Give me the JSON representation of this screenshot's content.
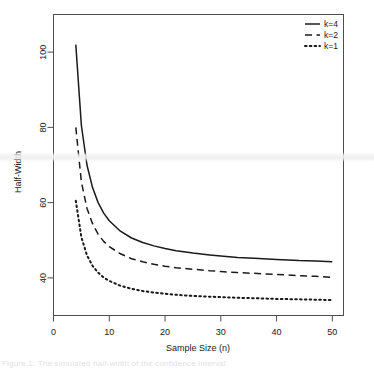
{
  "figure": {
    "background_color": "#ffffff",
    "foreground_color": "#1a1a1a",
    "bottom_text_fragment": "Figure 1: The simulated half-width of the confidence interval"
  },
  "chart_data": {
    "type": "line",
    "title": "",
    "xlabel": "Sample Size (n)",
    "ylabel": "Half-Width",
    "xlim": [
      0,
      52
    ],
    "ylim": [
      30,
      110
    ],
    "grid": false,
    "legend_position": "top-right",
    "xticks": [
      0,
      10,
      20,
      30,
      40,
      50
    ],
    "xtick_labels": [
      "0",
      "10",
      "20",
      "30",
      "40",
      "50"
    ],
    "yticks": [
      40,
      60,
      80,
      100
    ],
    "ytick_labels": [
      "40",
      "60",
      "80",
      "100"
    ],
    "x": [
      4,
      5,
      6,
      7,
      8,
      9,
      10,
      12,
      14,
      16,
      18,
      20,
      22,
      25,
      28,
      30,
      33,
      36,
      40,
      44,
      47,
      50
    ],
    "series": [
      {
        "name": "k=4",
        "linestyle": "solid",
        "color": "#1a1a1a",
        "values": [
          102.0,
          80.5,
          70.0,
          64.0,
          60.0,
          57.2,
          55.2,
          52.4,
          50.6,
          49.4,
          48.5,
          47.8,
          47.2,
          46.6,
          46.1,
          45.8,
          45.4,
          45.2,
          44.9,
          44.6,
          44.5,
          44.3
        ]
      },
      {
        "name": "k=2",
        "linestyle": "dashed",
        "color": "#1a1a1a",
        "values": [
          80.0,
          65.5,
          58.5,
          54.4,
          51.6,
          49.7,
          48.3,
          46.4,
          45.1,
          44.3,
          43.6,
          43.1,
          42.7,
          42.3,
          41.9,
          41.7,
          41.4,
          41.2,
          40.9,
          40.6,
          40.4,
          40.1
        ]
      },
      {
        "name": "k=1",
        "linestyle": "dotted",
        "color": "#1a1a1a",
        "values": [
          60.5,
          50.8,
          46.0,
          43.2,
          41.4,
          40.1,
          39.2,
          37.9,
          37.1,
          36.5,
          36.1,
          35.8,
          35.5,
          35.2,
          35.0,
          34.9,
          34.7,
          34.6,
          34.4,
          34.3,
          34.2,
          34.1
        ]
      }
    ],
    "legend_entries": [
      "k=4",
      "k=2",
      "k=1"
    ]
  }
}
